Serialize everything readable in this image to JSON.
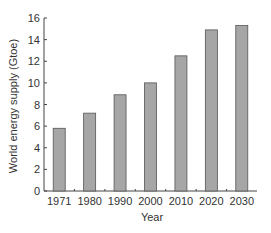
{
  "chart_data": {
    "type": "bar",
    "title": "",
    "xlabel": "Year",
    "ylabel": "World energy supply (Gtoe)",
    "categories": [
      "1971",
      "1980",
      "1990",
      "2000",
      "2010",
      "2020",
      "2030"
    ],
    "values": [
      5.8,
      7.2,
      8.9,
      10.0,
      12.5,
      14.9,
      15.3
    ],
    "ylim": [
      0,
      16
    ],
    "yticks": [
      0,
      2,
      4,
      6,
      8,
      10,
      12,
      14,
      16
    ],
    "grid": false,
    "legend": null,
    "bar_color": "#a6a6a6",
    "bar_edge_color": "#555555"
  }
}
